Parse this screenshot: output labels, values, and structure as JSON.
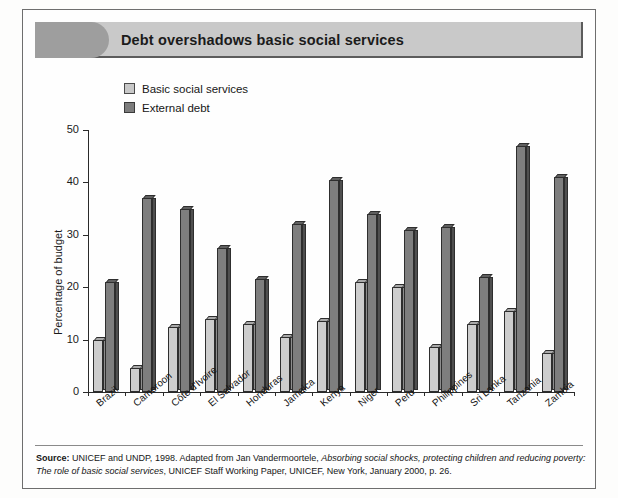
{
  "figure": {
    "title": "Debt overshadows basic social services",
    "source_label": "Source:",
    "source_text_1": " UNICEF and UNDP, 1998. Adapted from Jan Vandermoortele, ",
    "source_italic_1": "Absorbing social shocks, protecting children and reducing poverty: The role of basic social services",
    "source_text_2": ", UNICEF Staff Working Paper, UNICEF, New York, January 2000, p. 26."
  },
  "legend": {
    "items": [
      {
        "label": "Basic social services",
        "swatch": "light-gray-swatch",
        "color": "#c8c8c8"
      },
      {
        "label": "External debt",
        "swatch": "dark-gray-swatch",
        "color": "#7d7d7d"
      }
    ]
  },
  "chart_data": {
    "type": "bar",
    "title": "Debt overshadows basic social services",
    "xlabel": "",
    "ylabel": "Percentage of budget",
    "ylim": [
      0,
      50
    ],
    "yticks": [
      0,
      10,
      20,
      30,
      40,
      50
    ],
    "grid": false,
    "legend_position": "top-left",
    "categories": [
      "Brazil",
      "Cameroon",
      "Côte d'Ivoire",
      "El Salvador",
      "Honduras",
      "Jamaica",
      "Kenya",
      "Niger",
      "Peru",
      "Philippines",
      "Sri Lanka",
      "Tanzania",
      "Zambia"
    ],
    "series": [
      {
        "name": "Basic social services",
        "color": "#c8c8c8",
        "values": [
          10,
          4.5,
          12.5,
          14,
          13,
          10.5,
          13.5,
          21,
          20,
          8.5,
          13,
          15.5,
          7.5
        ]
      },
      {
        "name": "External debt",
        "color": "#7d7d7d",
        "values": [
          21,
          37,
          35,
          27.5,
          21.5,
          32,
          40.5,
          34,
          31,
          31.5,
          22,
          47,
          41
        ]
      }
    ]
  }
}
